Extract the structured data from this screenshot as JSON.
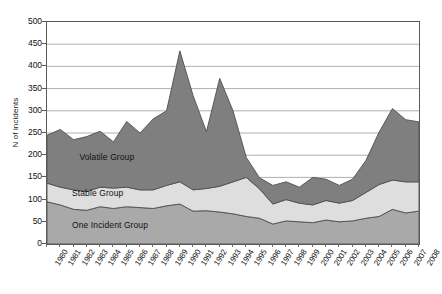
{
  "chart_data": {
    "type": "area",
    "title": "",
    "xlabel": "",
    "ylabel": "N of incidents",
    "ylim": [
      0,
      500
    ],
    "ytick_values": [
      0,
      50,
      100,
      150,
      200,
      250,
      300,
      350,
      400,
      450,
      500
    ],
    "grid": true,
    "stacked": true,
    "legend_position": "inline-labels",
    "categories": [
      "1980",
      "1981",
      "1982",
      "1983",
      "1984",
      "1985",
      "1986",
      "1987",
      "1988",
      "1989",
      "1990",
      "1991",
      "1992",
      "1993",
      "1994",
      "1995",
      "1996",
      "1997",
      "1998",
      "1999",
      "2000",
      "2001",
      "2002",
      "2003",
      "2004",
      "2005",
      "2006",
      "2007",
      "2008"
    ],
    "series": [
      {
        "name": "One Incident Group",
        "color": "#a9a9a9",
        "values": [
          95,
          88,
          78,
          76,
          84,
          80,
          84,
          82,
          80,
          86,
          90,
          74,
          75,
          72,
          68,
          62,
          58,
          45,
          52,
          50,
          48,
          54,
          50,
          52,
          58,
          62,
          78,
          70,
          74
        ]
      },
      {
        "name": "Stable Group",
        "color": "#dedede",
        "values": [
          42,
          40,
          44,
          42,
          44,
          46,
          44,
          40,
          42,
          46,
          50,
          48,
          50,
          58,
          72,
          88,
          66,
          45,
          48,
          42,
          40,
          44,
          42,
          46,
          58,
          72,
          66,
          70,
          66
        ]
      },
      {
        "name": "Volatile Group",
        "color": "#7f7f7f",
        "values": [
          108,
          130,
          113,
          124,
          126,
          104,
          148,
          128,
          160,
          168,
          295,
          212,
          128,
          243,
          160,
          45,
          25,
          42,
          40,
          36,
          62,
          48,
          40,
          48,
          72,
          118,
          161,
          140,
          135
        ]
      }
    ],
    "totals": [
      245,
      258,
      235,
      242,
      254,
      230,
      276,
      250,
      282,
      300,
      435,
      334,
      253,
      373,
      300,
      195,
      149,
      132,
      140,
      128,
      150,
      146,
      132,
      146,
      188,
      252,
      305,
      280,
      275
    ],
    "series_inline_labels": [
      {
        "text": "Volatile Group",
        "x_pct": 9,
        "y_value": 193
      },
      {
        "text": "Stable Group",
        "x_pct": 7,
        "y_value": 112
      },
      {
        "text": "One Incident Group",
        "x_pct": 7,
        "y_value": 40
      }
    ]
  },
  "caption": ""
}
